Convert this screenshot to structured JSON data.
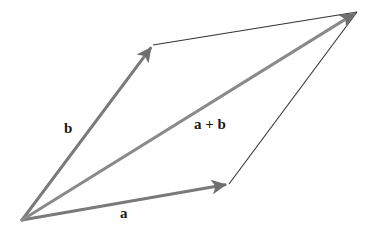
{
  "diagram": {
    "colors": {
      "vector_arrow": "#7a7a7a",
      "edge_line": "#333333",
      "label": "#1a1a1a",
      "background": "#ffffff"
    },
    "points": {
      "origin": [
        22,
        220
      ],
      "a_tip": [
        229,
        184
      ],
      "b_tip": [
        153,
        45
      ],
      "sum_tip": [
        357,
        12
      ]
    },
    "vectors": [
      {
        "id": "a",
        "label": "a",
        "from": "origin",
        "to": "a_tip",
        "label_pos": [
          120,
          206
        ]
      },
      {
        "id": "b",
        "label": "b",
        "from": "origin",
        "to": "b_tip",
        "label_pos": [
          64,
          121
        ]
      },
      {
        "id": "sum",
        "label": "a + b",
        "from": "origin",
        "to": "sum_tip",
        "label_pos": [
          194,
          117
        ]
      }
    ],
    "edges": [
      {
        "id": "b-to-sum",
        "from": "b_tip",
        "to": "sum_tip"
      },
      {
        "id": "a-to-sum",
        "from": "a_tip",
        "to": "sum_tip"
      }
    ]
  }
}
